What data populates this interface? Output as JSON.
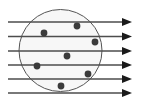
{
  "figure": {
    "type": "physics-scattering-diagram",
    "canvas": {
      "width": 142,
      "height": 111,
      "background": "#ffffff"
    },
    "colors": {
      "ray_line": "#4d4d4d",
      "arrow_head": "#1a1a1a",
      "circle_stroke": "#555555",
      "circle_fill": "#f7f7f7",
      "particle_fill": "#3b3b3b"
    },
    "circle": {
      "label": "circular-region",
      "cx": 60.5,
      "cy": 50.5,
      "rx": 41.5,
      "ry": 41.0,
      "stroke_width": 1.0
    },
    "rays": {
      "label": "parallel-rays",
      "count": 6,
      "direction": "left-to-right",
      "x_start": 8,
      "x_line_end": 122,
      "x_tip": 132,
      "stroke_width": 1.4,
      "arrow_half_height": 4.0,
      "arrow_length": 10,
      "y_positions": [
        22,
        36.5,
        51,
        65,
        79,
        93
      ]
    },
    "particles": {
      "label": "scattered-particles",
      "count": 7,
      "radius": 3.4,
      "points": [
        {
          "id": "particle-1",
          "x": 77,
          "y": 26
        },
        {
          "id": "particle-2",
          "x": 44,
          "y": 33
        },
        {
          "id": "particle-3",
          "x": 95,
          "y": 42
        },
        {
          "id": "particle-4",
          "x": 67,
          "y": 56
        },
        {
          "id": "particle-5",
          "x": 37,
          "y": 66
        },
        {
          "id": "particle-6",
          "x": 88,
          "y": 74
        },
        {
          "id": "particle-7",
          "x": 61,
          "y": 86
        }
      ]
    }
  }
}
